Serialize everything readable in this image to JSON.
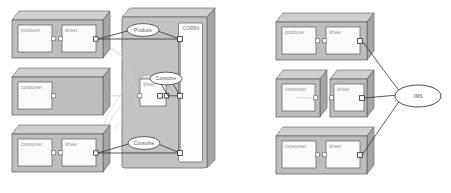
{
  "figure": {
    "title": "",
    "panels": [
      {
        "id": "left-panel",
        "name": "corba-architecture-panel",
        "middleware": {
          "label": "CORBA",
          "shape": "rounded-rectangle-3d"
        },
        "nodes": [
          {
            "id": "l-producer",
            "label": "producer",
            "row": 0
          },
          {
            "id": "l-driver-0",
            "label": "driver",
            "row": 0
          },
          {
            "id": "l-consumer-1",
            "label": "consumer",
            "row": 1
          },
          {
            "id": "l-driver-1",
            "label": "driver",
            "row": 1
          },
          {
            "id": "l-consumer-2",
            "label": "consumer",
            "row": 2
          },
          {
            "id": "l-driver-2",
            "label": "driver",
            "row": 2
          }
        ],
        "interfaces": [
          {
            "id": "l-produce",
            "label": "Produce",
            "shape": "ellipse"
          },
          {
            "id": "l-consume-mid",
            "label": "Consume",
            "shape": "ellipse"
          },
          {
            "id": "l-consume-bot",
            "label": "Consume",
            "shape": "ellipse"
          }
        ]
      },
      {
        "id": "right-panel",
        "name": "jms-architecture-panel",
        "middleware": {
          "label": "JMS",
          "shape": "ellipse"
        },
        "nodes": [
          {
            "id": "r-producer",
            "label": "producer",
            "row": 0
          },
          {
            "id": "r-driver-0",
            "label": "driver",
            "row": 0
          },
          {
            "id": "r-consumer-1",
            "label": "consumer",
            "row": 1
          },
          {
            "id": "r-driver-1",
            "label": "driver",
            "row": 1
          },
          {
            "id": "r-consumer-2",
            "label": "consumer",
            "row": 2
          },
          {
            "id": "r-driver-2",
            "label": "driver",
            "row": 2
          }
        ],
        "interfaces": []
      }
    ],
    "colors": {
      "component_fill": "#b8b8b8",
      "component_top": "#cfcfcf",
      "component_side": "#9a9a9a",
      "inner_box_fill": "#fbfbfb",
      "middleware_fill": "#c4c4c4",
      "middleware_inner": "#fdfdfd",
      "stroke": "#5a5a5a",
      "connector_thin": "#b0b0b0",
      "label_text": "#8d8d8d",
      "background": "#ffffff"
    }
  }
}
